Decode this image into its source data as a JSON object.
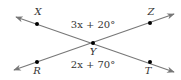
{
  "diagram": {
    "type": "intersecting-lines",
    "colors": {
      "line": "#777777",
      "point": "#000000",
      "text": "#333333"
    },
    "points": {
      "X": {
        "label": "X",
        "x": 37,
        "y": 24,
        "label_x": 38,
        "label_y": 15
      },
      "Z": {
        "label": "Z",
        "x": 150,
        "y": 23,
        "label_x": 151,
        "label_y": 15
      },
      "Y": {
        "label": "Y",
        "x": 93,
        "y": 43,
        "label_x": 93,
        "label_y": 55
      },
      "R": {
        "label": "R",
        "x": 37,
        "y": 62,
        "label_x": 37,
        "label_y": 74
      },
      "T": {
        "label": "T",
        "x": 150,
        "y": 62,
        "label_x": 148,
        "label_y": 74
      }
    },
    "lines": [
      {
        "name": "line-XT",
        "from": [
          16,
          17
        ],
        "to": [
          174,
          72
        ]
      },
      {
        "name": "line-RZ",
        "from": [
          14,
          70
        ],
        "to": [
          174,
          14
        ]
      }
    ],
    "angles": {
      "top": {
        "expression": "3x + 20°",
        "x": 93,
        "y": 28
      },
      "bottom": {
        "expression": "2x + 70°",
        "x": 93,
        "y": 68
      }
    }
  }
}
